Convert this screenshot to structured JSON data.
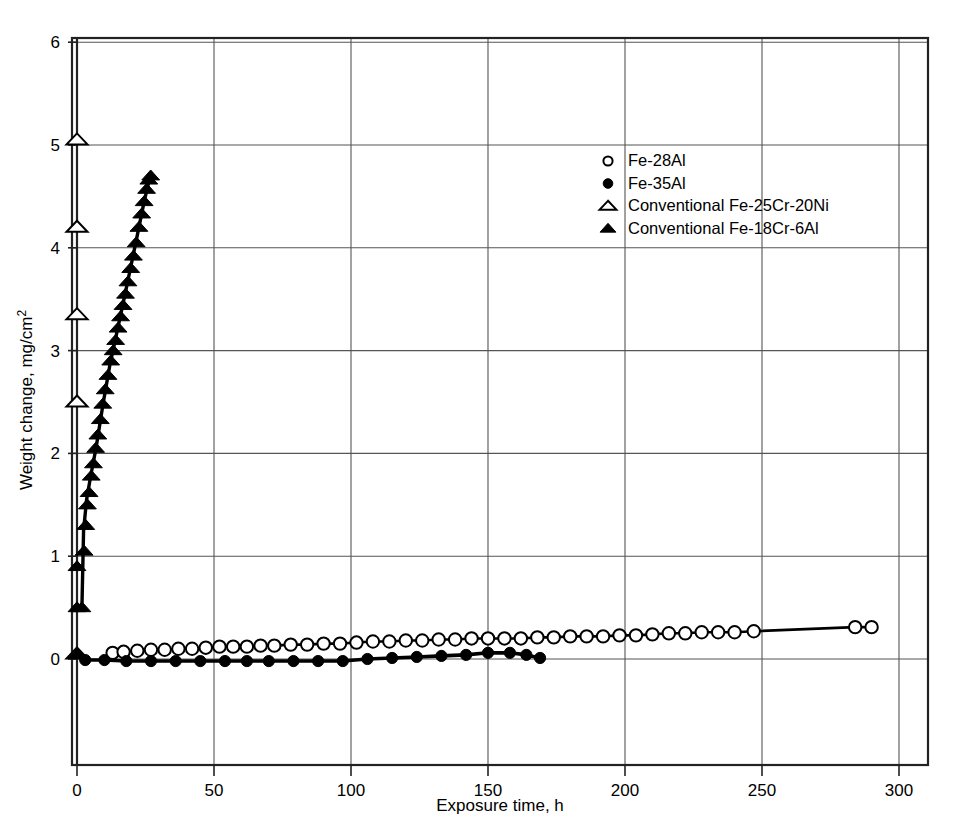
{
  "chart_data": {
    "type": "scatter",
    "title": "",
    "xlabel": "Exposure time, h",
    "ylabel": "Weight change, mg/cm²",
    "xlim": [
      0,
      300
    ],
    "ylim": [
      -1,
      6
    ],
    "xticks": [
      0,
      50,
      100,
      150,
      200,
      250,
      300
    ],
    "yticks": [
      0,
      1,
      2,
      3,
      4,
      5,
      6
    ],
    "xtick_labels": [
      "0",
      "50",
      "100",
      "150",
      "200",
      "250",
      "300"
    ],
    "ytick_labels": [
      "0",
      "1",
      "2",
      "3",
      "4",
      "5",
      "6"
    ],
    "grid": true,
    "grid_axis": "both",
    "legend_position": "upper center",
    "series": [
      {
        "name": "Fe-28Al",
        "marker": "open-circle",
        "has_line": true,
        "points": [
          [
            13,
            0.06
          ],
          [
            17,
            0.07
          ],
          [
            22,
            0.08
          ],
          [
            27,
            0.09
          ],
          [
            32,
            0.09
          ],
          [
            37,
            0.1
          ],
          [
            42,
            0.1
          ],
          [
            47,
            0.11
          ],
          [
            52,
            0.12
          ],
          [
            57,
            0.12
          ],
          [
            62,
            0.12
          ],
          [
            67,
            0.13
          ],
          [
            72,
            0.13
          ],
          [
            78,
            0.14
          ],
          [
            84,
            0.14
          ],
          [
            90,
            0.15
          ],
          [
            96,
            0.15
          ],
          [
            102,
            0.16
          ],
          [
            108,
            0.17
          ],
          [
            114,
            0.17
          ],
          [
            120,
            0.18
          ],
          [
            126,
            0.18
          ],
          [
            132,
            0.19
          ],
          [
            138,
            0.19
          ],
          [
            144,
            0.2
          ],
          [
            150,
            0.2
          ],
          [
            156,
            0.2
          ],
          [
            162,
            0.2
          ],
          [
            168,
            0.21
          ],
          [
            174,
            0.21
          ],
          [
            180,
            0.22
          ],
          [
            186,
            0.22
          ],
          [
            192,
            0.22
          ],
          [
            198,
            0.23
          ],
          [
            204,
            0.23
          ],
          [
            210,
            0.24
          ],
          [
            216,
            0.25
          ],
          [
            222,
            0.25
          ],
          [
            228,
            0.26
          ],
          [
            234,
            0.26
          ],
          [
            240,
            0.26
          ],
          [
            247,
            0.27
          ],
          [
            284,
            0.31
          ],
          [
            290,
            0.31
          ]
        ]
      },
      {
        "name": "Fe-35Al",
        "marker": "filled-circle",
        "has_line": true,
        "points": [
          [
            3,
            -0.01
          ],
          [
            10,
            -0.01
          ],
          [
            18,
            -0.02
          ],
          [
            27,
            -0.02
          ],
          [
            36,
            -0.02
          ],
          [
            45,
            -0.02
          ],
          [
            54,
            -0.02
          ],
          [
            62,
            -0.02
          ],
          [
            70,
            -0.02
          ],
          [
            79,
            -0.02
          ],
          [
            88,
            -0.02
          ],
          [
            97,
            -0.02
          ],
          [
            106,
            0.0
          ],
          [
            115,
            0.01
          ],
          [
            124,
            0.02
          ],
          [
            133,
            0.03
          ],
          [
            142,
            0.04
          ],
          [
            150,
            0.06
          ],
          [
            158,
            0.06
          ],
          [
            164,
            0.04
          ],
          [
            169,
            0.01
          ]
        ]
      },
      {
        "name": "Conventional Fe-25Cr-20Ni",
        "marker": "open-triangle",
        "has_line": false,
        "points": [
          [
            0,
            0.05
          ],
          [
            0,
            2.5
          ],
          [
            0,
            3.35
          ],
          [
            0,
            4.2
          ],
          [
            0,
            5.05
          ]
        ]
      },
      {
        "name": "Conventional Fe-18Cr-6Al",
        "marker": "filled-triangle",
        "has_line": true,
        "points": [
          [
            0,
            0.05
          ],
          [
            0,
            0.5
          ],
          [
            0,
            0.9
          ],
          [
            1.8,
            0.5
          ],
          [
            2.6,
            1.05
          ],
          [
            3.2,
            1.3
          ],
          [
            3.8,
            1.5
          ],
          [
            4.4,
            1.62
          ],
          [
            5.2,
            1.78
          ],
          [
            6.0,
            1.9
          ],
          [
            6.8,
            2.05
          ],
          [
            7.6,
            2.18
          ],
          [
            8.5,
            2.33
          ],
          [
            9.4,
            2.48
          ],
          [
            10.3,
            2.62
          ],
          [
            11.3,
            2.76
          ],
          [
            12.3,
            2.9
          ],
          [
            13.2,
            3.0
          ],
          [
            14.1,
            3.1
          ],
          [
            15.0,
            3.22
          ],
          [
            15.9,
            3.33
          ],
          [
            16.8,
            3.44
          ],
          [
            17.7,
            3.55
          ],
          [
            18.6,
            3.67
          ],
          [
            19.6,
            3.8
          ],
          [
            20.6,
            3.92
          ],
          [
            21.6,
            4.05
          ],
          [
            22.6,
            4.2
          ],
          [
            23.6,
            4.33
          ],
          [
            24.5,
            4.45
          ],
          [
            25.4,
            4.57
          ],
          [
            26.2,
            4.66
          ],
          [
            26.9,
            4.7
          ]
        ],
        "fit_line": [
          [
            1.8,
            0.5
          ],
          [
            2.4,
            1.25
          ],
          [
            3.5,
            1.55
          ],
          [
            5.0,
            1.78
          ],
          [
            7.0,
            2.06
          ],
          [
            9.5,
            2.48
          ],
          [
            12.0,
            2.86
          ],
          [
            14.5,
            3.17
          ],
          [
            17.0,
            3.48
          ],
          [
            19.5,
            3.8
          ],
          [
            22.0,
            4.12
          ],
          [
            24.5,
            4.45
          ],
          [
            26.9,
            4.72
          ]
        ]
      }
    ]
  },
  "legend": {
    "items": [
      {
        "marker": "open-circle",
        "label": "Fe-28Al"
      },
      {
        "marker": "filled-circle",
        "label": "Fe-35Al"
      },
      {
        "marker": "open-triangle",
        "label": "Conventional Fe-25Cr-20Ni"
      },
      {
        "marker": "filled-triangle",
        "label": "Conventional Fe-18Cr-6Al"
      }
    ]
  },
  "colors": {
    "background": "#ffffff",
    "ink": "#000000",
    "grid": "#555555",
    "frame": "#222222"
  }
}
